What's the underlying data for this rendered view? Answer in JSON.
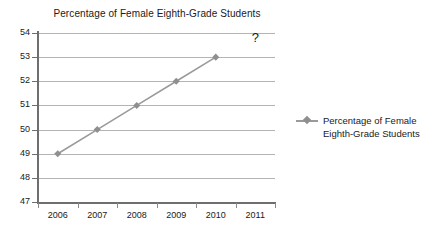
{
  "chart_data": {
    "type": "line",
    "title": "Percentage of Female Eighth-Grade Students",
    "xlabel": "",
    "ylabel": "",
    "categories": [
      "2006",
      "2007",
      "2008",
      "2009",
      "2010",
      "2011"
    ],
    "series": [
      {
        "name": "Percentage of Female Eighth-Grade Students",
        "values": [
          49,
          50,
          51,
          52,
          53,
          null
        ]
      }
    ],
    "ylim": [
      47,
      54
    ],
    "ytick_step": 1,
    "yticks": [
      "54",
      "53",
      "52",
      "51",
      "50",
      "49",
      "48",
      "47"
    ],
    "grid": true,
    "legend_position": "right",
    "annotations": [
      {
        "text": "?",
        "x_category": "2011",
        "y": 54
      }
    ],
    "colors": {
      "series": "#9a9a9a",
      "marker": "#8f8f8f",
      "gridline": "#b4b4b4",
      "axis": "#6e6e6e",
      "text": "#1a1a1a",
      "background": "#ffffff"
    }
  },
  "legend": {
    "entries": [
      {
        "label": "Percentage of Female\nEighth-Grade Students",
        "marker": "diamond-line-marker"
      }
    ]
  }
}
